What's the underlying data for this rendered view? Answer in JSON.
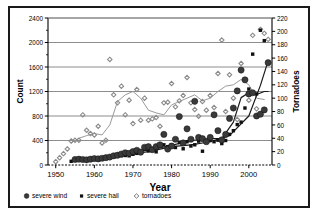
{
  "chart_data": {
    "type": "scatter",
    "title": "",
    "xlabel": "Year",
    "ylabel": "Count",
    "y2label": "Tornadoes",
    "xlim": [
      1948,
      2006
    ],
    "ylim": [
      0,
      2400
    ],
    "y2lim": [
      0,
      220
    ],
    "xticks": [
      1950,
      1960,
      1970,
      1980,
      1990,
      2000
    ],
    "xtick_labels": [
      "1950",
      "1960",
      "1970",
      "1980",
      "1990",
      "2000"
    ],
    "yticks": [
      0,
      400,
      800,
      1200,
      1600,
      2000,
      2400
    ],
    "ytick_labels": [
      "0",
      "400",
      "800",
      "1200",
      "1600",
      "2000",
      "2400"
    ],
    "y2ticks": [
      0,
      20,
      40,
      60,
      80,
      100,
      120,
      140,
      160,
      180,
      200,
      220
    ],
    "y2tick_labels": [
      "0",
      "20",
      "40",
      "60",
      "80",
      "100",
      "120",
      "140",
      "160",
      "180",
      "200",
      "220"
    ],
    "grid": "horizontal",
    "legend_position": "bottom-left",
    "legend": [
      {
        "label": "severe wind",
        "marker": "large-filled-circle",
        "color": "#3a3a3a"
      },
      {
        "label": "severe hail",
        "marker": "small-filled-square",
        "color": "#111111"
      },
      {
        "label": "tornadoes",
        "marker": "small-open-diamond",
        "color": "#7a7a7a"
      }
    ],
    "series": [
      {
        "name": "tornadoes",
        "axis": "right",
        "marker": "small-open-diamond",
        "color": "#8a8a8a",
        "x": [
          1950,
          1951,
          1952,
          1953,
          1954,
          1955,
          1956,
          1957,
          1958,
          1959,
          1960,
          1961,
          1962,
          1963,
          1964,
          1965,
          1966,
          1967,
          1968,
          1969,
          1970,
          1971,
          1972,
          1973,
          1974,
          1975,
          1976,
          1977,
          1978,
          1979,
          1980,
          1981,
          1982,
          1983,
          1984,
          1985,
          1986,
          1987,
          1988,
          1989,
          1990,
          1991,
          1992,
          1993,
          1994,
          1995,
          1996,
          1997,
          1998,
          1999,
          2000,
          2001,
          2002,
          2003,
          2004,
          2005
        ],
        "values": [
          5,
          11,
          17,
          24,
          36,
          37,
          37,
          75,
          52,
          47,
          45,
          58,
          33,
          37,
          158,
          105,
          93,
          118,
          75,
          97,
          62,
          113,
          67,
          100,
          67,
          69,
          71,
          58,
          93,
          94,
          122,
          87,
          96,
          104,
          131,
          93,
          83,
          73,
          95,
          82,
          104,
          86,
          137,
          187,
          80,
          135,
          100,
          68,
          152,
          128,
          97,
          194,
          84,
          203,
          197,
          188
        ]
      },
      {
        "name": "severe hail",
        "axis": "left",
        "marker": "small-filled-square",
        "color": "#111111",
        "x": [
          1954,
          1955,
          1956,
          1957,
          1958,
          1959,
          1960,
          1961,
          1962,
          1963,
          1964,
          1965,
          1966,
          1967,
          1968,
          1969,
          1970,
          1971,
          1972,
          1973,
          1974,
          1975,
          1976,
          1977,
          1978,
          1979,
          1980,
          1981,
          1982,
          1983,
          1984,
          1985,
          1986,
          1987,
          1988,
          1989,
          1990,
          1991,
          1992,
          1993,
          1994,
          1995,
          1996,
          1997,
          1998,
          1999,
          2000,
          2001,
          2002,
          2003,
          2004,
          2005
        ],
        "values": [
          60,
          105,
          95,
          90,
          85,
          95,
          110,
          100,
          95,
          115,
          120,
          135,
          140,
          150,
          155,
          150,
          175,
          190,
          200,
          260,
          230,
          250,
          215,
          330,
          330,
          300,
          330,
          285,
          365,
          265,
          380,
          310,
          330,
          390,
          225,
          390,
          400,
          380,
          405,
          350,
          400,
          500,
          560,
          660,
          700,
          930,
          1240,
          1810,
          1160,
          2200,
          2030,
          1680
        ]
      },
      {
        "name": "severe wind",
        "axis": "left",
        "marker": "large-filled-circle",
        "color": "#3a3a3a",
        "x": [
          1955,
          1956,
          1957,
          1958,
          1959,
          1960,
          1961,
          1962,
          1963,
          1964,
          1965,
          1966,
          1967,
          1968,
          1969,
          1970,
          1971,
          1972,
          1973,
          1974,
          1975,
          1976,
          1977,
          1978,
          1979,
          1980,
          1981,
          1982,
          1983,
          1984,
          1985,
          1986,
          1987,
          1988,
          1989,
          1990,
          1991,
          1992,
          1993,
          1994,
          1995,
          1996,
          1997,
          1998,
          1999,
          2000,
          2001,
          2002,
          2003,
          2004,
          2005
        ],
        "values": [
          90,
          95,
          90,
          85,
          95,
          105,
          100,
          110,
          120,
          130,
          150,
          160,
          180,
          200,
          190,
          220,
          240,
          210,
          290,
          300,
          250,
          300,
          330,
          500,
          260,
          310,
          420,
          790,
          360,
          590,
          420,
          1040,
          450,
          430,
          380,
          450,
          820,
          560,
          410,
          500,
          760,
          930,
          1210,
          1550,
          1390,
          1160,
          1180,
          800,
          830,
          900,
          1670
        ]
      }
    ],
    "trend_lines": [
      {
        "name": "tornadoes-trend",
        "axis": "right",
        "color": "#9a9a9a",
        "x": [
          1954,
          1956,
          1958,
          1960,
          1962,
          1964,
          1966,
          1968,
          1970,
          1972,
          1974,
          1976,
          1978,
          1980,
          1982,
          1984,
          1986,
          1988,
          1990,
          1992,
          1994,
          1996,
          1998,
          2000,
          2002,
          2004
        ],
        "values": [
          33,
          40,
          44,
          47,
          45,
          60,
          95,
          105,
          110,
          100,
          82,
          78,
          75,
          90,
          95,
          100,
          105,
          96,
          100,
          110,
          118,
          120,
          128,
          120,
          100,
          98
        ]
      },
      {
        "name": "severe-hail-trend",
        "axis": "left",
        "color": "#1a1a1a",
        "x": [
          1955,
          1960,
          1965,
          1970,
          1975,
          1980,
          1985,
          1990,
          1995,
          2000,
          2003,
          2005
        ],
        "values": [
          80,
          100,
          130,
          175,
          230,
          300,
          330,
          380,
          480,
          800,
          1300,
          1700
        ]
      },
      {
        "name": "severe-wind-trend",
        "axis": "left",
        "color": "#1a1a1a",
        "x": [
          1971,
          1975,
          1980,
          1985,
          1990,
          1993,
          1996,
          1998,
          2000,
          2002,
          2004,
          2005
        ],
        "values": [
          215,
          255,
          320,
          400,
          430,
          430,
          700,
          1100,
          1180,
          1150,
          1200,
          1200
        ]
      }
    ]
  }
}
